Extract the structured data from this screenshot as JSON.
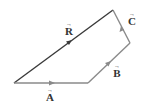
{
  "diagram": {
    "colors": {
      "resultant": "#3a3a3a",
      "components": "#8a8a8a",
      "text": "#333333"
    },
    "points": {
      "origin": [
        14,
        83
      ],
      "a_end": [
        88,
        83
      ],
      "b_end": [
        130,
        43
      ],
      "c_end": [
        113,
        10
      ]
    },
    "vectors": [
      {
        "id": "A",
        "label": "A",
        "arrow": "→"
      },
      {
        "id": "B",
        "label": "B",
        "arrow": "→"
      },
      {
        "id": "C",
        "label": "C",
        "arrow": "→"
      },
      {
        "id": "R",
        "label": "R",
        "arrow": "→"
      }
    ]
  }
}
